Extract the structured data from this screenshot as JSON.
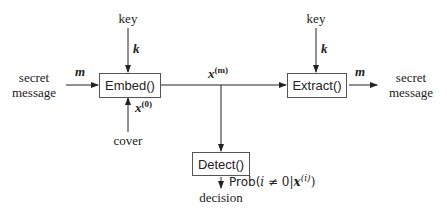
{
  "diagram": {
    "nodes": {
      "embed": {
        "label": "Embed()"
      },
      "extract": {
        "label": "Extract()"
      },
      "detect": {
        "label": "Detect()"
      }
    },
    "inputs": {
      "key_left": "key",
      "key_right": "key",
      "secret_message_in_line1": "secret",
      "secret_message_in_line2": "message",
      "cover": "cover"
    },
    "outputs": {
      "secret_message_out_line1": "secret",
      "secret_message_out_line2": "message",
      "decision": "decision"
    },
    "edge_labels": {
      "k_left": "k",
      "k_right": "k",
      "m_in": "m",
      "m_out": "m",
      "x_m_base": "x",
      "x_m_sup": "(m)",
      "x_0_base": "x",
      "x_0_sup": "(0)",
      "prob_prefix": "Prob(",
      "prob_i": "i",
      "prob_neq": " ≠ 0|",
      "prob_x": "x",
      "prob_sup": "(i)",
      "prob_suffix": ")"
    },
    "edges": [
      {
        "from": "secret message",
        "to": "Embed()",
        "label": "m"
      },
      {
        "from": "key",
        "to": "Embed()",
        "label": "k"
      },
      {
        "from": "cover",
        "to": "Embed()",
        "label": "x^(0)"
      },
      {
        "from": "Embed()",
        "to": "Extract()",
        "label": "x^(m)"
      },
      {
        "from": "Embed()",
        "to": "Detect()",
        "label": "x^(m)"
      },
      {
        "from": "key",
        "to": "Extract()",
        "label": "k"
      },
      {
        "from": "Extract()",
        "to": "secret message",
        "label": "m"
      },
      {
        "from": "Detect()",
        "to": "decision",
        "label": "Prob(i ≠ 0|x^(i))"
      }
    ]
  }
}
